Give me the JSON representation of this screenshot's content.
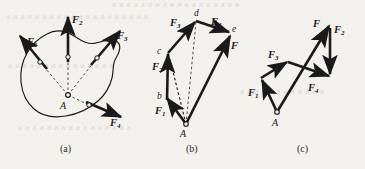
{
  "figure": {
    "background_color": "#f2f1ec",
    "ink_color": "#1a1a1a",
    "bleed_color": "#d9d7cf",
    "panels": [
      {
        "id": "a",
        "caption": "(a)",
        "description": "rigid body with four concurrent forces at point A"
      },
      {
        "id": "b",
        "caption": "(b)",
        "description": "force polygon A-b-c-d-e with resultant F"
      },
      {
        "id": "c",
        "caption": "(c)",
        "description": "alternate-order force polygon with resultant F"
      }
    ]
  },
  "panel_a": {
    "caption": "(a)",
    "point_label": "A",
    "forces": [
      {
        "name": "F1",
        "label": "F",
        "subscript": "1",
        "direction": "up-left"
      },
      {
        "name": "F2",
        "label": "F",
        "subscript": "2",
        "direction": "up"
      },
      {
        "name": "F3",
        "label": "F",
        "subscript": "3",
        "direction": "up-right"
      },
      {
        "name": "F4",
        "label": "F",
        "subscript": "4",
        "direction": "down-right"
      }
    ]
  },
  "panel_b": {
    "caption": "(b)",
    "vertices": [
      "A",
      "b",
      "c",
      "d",
      "e"
    ],
    "forces": [
      {
        "name": "F1",
        "label": "F",
        "subscript": "1"
      },
      {
        "name": "F2",
        "label": "F",
        "subscript": "2"
      },
      {
        "name": "F3",
        "label": "F",
        "subscript": "3"
      },
      {
        "name": "F4",
        "label": "F",
        "subscript": "4"
      }
    ],
    "resultant": {
      "name": "F",
      "label": "F",
      "subscript": ""
    }
  },
  "panel_c": {
    "caption": "(c)",
    "point_label": "A",
    "forces": [
      {
        "name": "F1",
        "label": "F",
        "subscript": "1"
      },
      {
        "name": "F3",
        "label": "F",
        "subscript": "3"
      },
      {
        "name": "F2",
        "label": "F",
        "subscript": "2"
      },
      {
        "name": "F4",
        "label": "F",
        "subscript": "4"
      }
    ],
    "resultant": {
      "name": "F",
      "label": "F",
      "subscript": ""
    }
  },
  "bleed_text": {
    "line1": "a a a a a a a a a a a a a a a a a a",
    "line2": "a a a a a a a a a a a a a a a a a a a a",
    "line3": "a a a a a a a a a a a a a a a",
    "line4": "a a a a a a a a a a a a",
    "line5": "a a a a a a a a a a a a a a a a"
  }
}
